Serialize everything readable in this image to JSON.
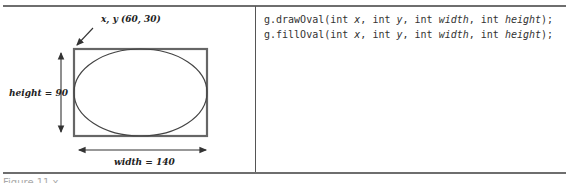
{
  "figure": {
    "origin_label": "x, y (60, 30)",
    "height_label": "height = 90",
    "width_label": "width = 140"
  },
  "code": {
    "lines": [
      {
        "method": "g.drawOval(",
        "p1t": "int ",
        "p1": "x",
        "s1": ", ",
        "p2t": "int ",
        "p2": "y",
        "s2": ", ",
        "p3t": "int ",
        "p3": "width",
        "s3": ", ",
        "p4t": "int ",
        "p4": "height",
        "end": ");"
      },
      {
        "method": "g.fillOval(",
        "p1t": "int ",
        "p1": "x",
        "s1": ", ",
        "p2t": "int ",
        "p2": "y",
        "s2": ", ",
        "p3t": "int ",
        "p3": "width",
        "s3": ", ",
        "p4t": "int ",
        "p4": "height",
        "end": ");"
      }
    ]
  },
  "caption": "Figure 11.x"
}
